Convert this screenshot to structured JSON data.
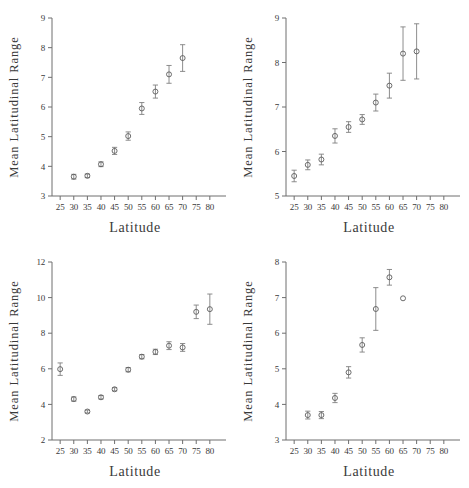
{
  "figure": {
    "title": "",
    "panel_count": 4,
    "shared_xlabel": "Latitude",
    "shared_ylabel": "Mean Latitudinal Range",
    "marker_style": "open-circle",
    "error_bar_style": "vertical-capped",
    "colors": {
      "axis": "#6e6e6e",
      "marker": "#5c5c5c",
      "errorbar": "#808080",
      "text": "#3a3a3a",
      "background": "#ffffff"
    }
  },
  "chart_data": [
    {
      "type": "scatter",
      "id": "panel-top-left",
      "title": "",
      "xlabel": "Latitude",
      "ylabel": "Mean Latitudinal Range",
      "xlim": [
        22,
        83
      ],
      "ylim": [
        3,
        9
      ],
      "xticks": [
        25,
        30,
        35,
        40,
        45,
        50,
        55,
        60,
        65,
        70,
        75,
        80
      ],
      "yticks": [
        3,
        4,
        5,
        6,
        7,
        8,
        9
      ],
      "grid": false,
      "legend": "none",
      "x": [
        30,
        35,
        40,
        45,
        50,
        55,
        60,
        65,
        70
      ],
      "y": [
        3.65,
        3.68,
        4.07,
        4.52,
        5.02,
        5.95,
        6.52,
        7.1,
        7.65
      ],
      "yerr": [
        0.08,
        0.06,
        0.08,
        0.12,
        0.14,
        0.2,
        0.22,
        0.3,
        0.45
      ]
    },
    {
      "type": "scatter",
      "id": "panel-top-right",
      "title": "",
      "xlabel": "Latitude",
      "ylabel": "Mean Latitudinal Range",
      "xlim": [
        22,
        83
      ],
      "ylim": [
        5,
        9
      ],
      "xticks": [
        25,
        30,
        35,
        40,
        45,
        50,
        55,
        60,
        65,
        70,
        75,
        80
      ],
      "yticks": [
        5,
        6,
        7,
        8,
        9
      ],
      "grid": false,
      "legend": "none",
      "x": [
        25,
        30,
        35,
        40,
        45,
        50,
        55,
        60,
        65,
        70
      ],
      "y": [
        5.45,
        5.7,
        5.82,
        6.35,
        6.55,
        6.72,
        7.1,
        7.48,
        8.2,
        8.25
      ],
      "yerr": [
        0.13,
        0.11,
        0.12,
        0.16,
        0.12,
        0.11,
        0.19,
        0.28,
        0.6,
        0.62
      ]
    },
    {
      "type": "scatter",
      "id": "panel-bottom-left",
      "title": "",
      "xlabel": "Latitude",
      "ylabel": "Mean Latitudinal Range",
      "xlim": [
        22,
        83
      ],
      "ylim": [
        2,
        12
      ],
      "xticks": [
        25,
        30,
        35,
        40,
        45,
        50,
        55,
        60,
        65,
        70,
        75,
        80
      ],
      "yticks": [
        2,
        4,
        6,
        8,
        10,
        12
      ],
      "grid": false,
      "legend": "none",
      "x": [
        25,
        30,
        35,
        40,
        45,
        50,
        55,
        60,
        65,
        70,
        75,
        80
      ],
      "y": [
        5.98,
        4.3,
        3.6,
        4.4,
        4.85,
        5.95,
        6.68,
        6.95,
        7.3,
        7.2,
        9.2,
        9.35
      ],
      "yerr": [
        0.35,
        0.12,
        0.08,
        0.1,
        0.09,
        0.12,
        0.12,
        0.15,
        0.22,
        0.22,
        0.38,
        0.85
      ]
    },
    {
      "type": "scatter",
      "id": "panel-bottom-right",
      "title": "",
      "xlabel": "Latitude",
      "ylabel": "Mean Latitudinal Range",
      "xlim": [
        22,
        83
      ],
      "ylim": [
        3,
        8
      ],
      "xticks": [
        25,
        30,
        35,
        40,
        45,
        50,
        55,
        60,
        65,
        70,
        75,
        80
      ],
      "yticks": [
        3,
        4,
        5,
        6,
        7,
        8
      ],
      "grid": false,
      "legend": "none",
      "x": [
        30,
        35,
        40,
        45,
        50,
        55,
        60,
        65
      ],
      "y": [
        3.7,
        3.7,
        4.18,
        4.9,
        5.67,
        6.68,
        7.57,
        6.98
      ],
      "yerr": [
        0.11,
        0.1,
        0.13,
        0.16,
        0.2,
        0.6,
        0.22,
        0.0
      ]
    }
  ]
}
